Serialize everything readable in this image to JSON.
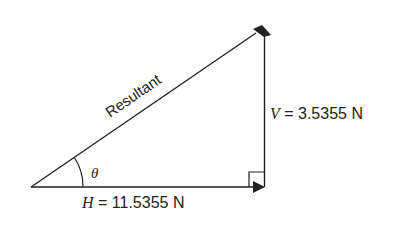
{
  "diagram": {
    "type": "vector-triangle",
    "resultant_label": "Resultant",
    "angle_label": "θ",
    "horizontal": {
      "symbol": "H",
      "equals": " = ",
      "value": "11.5355 N"
    },
    "vertical": {
      "symbol": "V",
      "equals": " = ",
      "value": "3.5355 N"
    },
    "colors": {
      "line": "#222222",
      "background": "#ffffff"
    }
  }
}
